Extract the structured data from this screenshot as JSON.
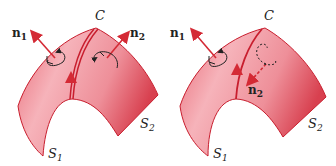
{
  "figure": {
    "left": {
      "curve_label": "C",
      "normal_1": {
        "letter": "n",
        "sub": "1"
      },
      "normal_2": {
        "letter": "n",
        "sub": "2"
      },
      "surface_1": {
        "letter": "S",
        "sub": "1"
      },
      "surface_2": {
        "letter": "S",
        "sub": "2"
      }
    },
    "right": {
      "curve_label": "C",
      "normal_1": {
        "letter": "n",
        "sub": "1"
      },
      "normal_2": {
        "letter": "n",
        "sub": "2"
      },
      "surface_1": {
        "letter": "S",
        "sub": "1"
      },
      "surface_2": {
        "letter": "S",
        "sub": "2"
      }
    }
  },
  "colors": {
    "surface_light": "#f2a3ab",
    "surface_dark": "#d8404f",
    "edge": "#c81e2e",
    "arrow": "#d42a35",
    "text": "#222222"
  }
}
